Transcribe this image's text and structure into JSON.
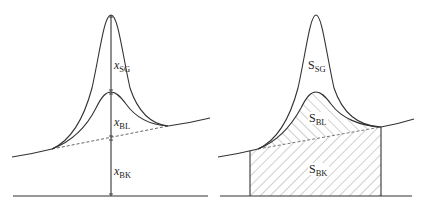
{
  "left_panel": {
    "labels": {
      "sg": {
        "main": "x",
        "sub": "SG"
      },
      "bl": {
        "main": "x",
        "sub": "BL"
      },
      "bk": {
        "main": "x",
        "sub": "BK"
      }
    }
  },
  "right_panel": {
    "labels": {
      "sg": {
        "main": "S",
        "sub": "SG"
      },
      "bl": {
        "main": "S",
        "sub": "BL"
      },
      "bk": {
        "main": "S",
        "sub": "BK"
      }
    }
  },
  "colors": {
    "line": "#333333",
    "hatch": "#777777",
    "background": "#ffffff"
  }
}
